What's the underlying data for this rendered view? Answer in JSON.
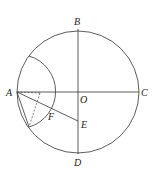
{
  "diagram": {
    "type": "geometry",
    "points": {
      "A": {
        "label": "A",
        "x": 17,
        "y": 92
      },
      "B": {
        "label": "B",
        "x": 78,
        "y": 29
      },
      "C": {
        "label": "C",
        "x": 139,
        "y": 92
      },
      "D": {
        "label": "D",
        "x": 78,
        "y": 154
      },
      "O": {
        "label": "O",
        "x": 78,
        "y": 92
      },
      "E": {
        "label": "E",
        "x": 78,
        "y": 121
      },
      "F": {
        "label": "F",
        "x": 50,
        "y": 108
      }
    },
    "circle": {
      "center": "O",
      "radius": 61
    },
    "arc": {
      "center": "A",
      "radius": 37
    },
    "segments": [
      "AC",
      "BD",
      "AE"
    ],
    "dashed_segments": [
      "A-P",
      "P-Q"
    ],
    "solid_extra": [
      "A-Q"
    ]
  }
}
